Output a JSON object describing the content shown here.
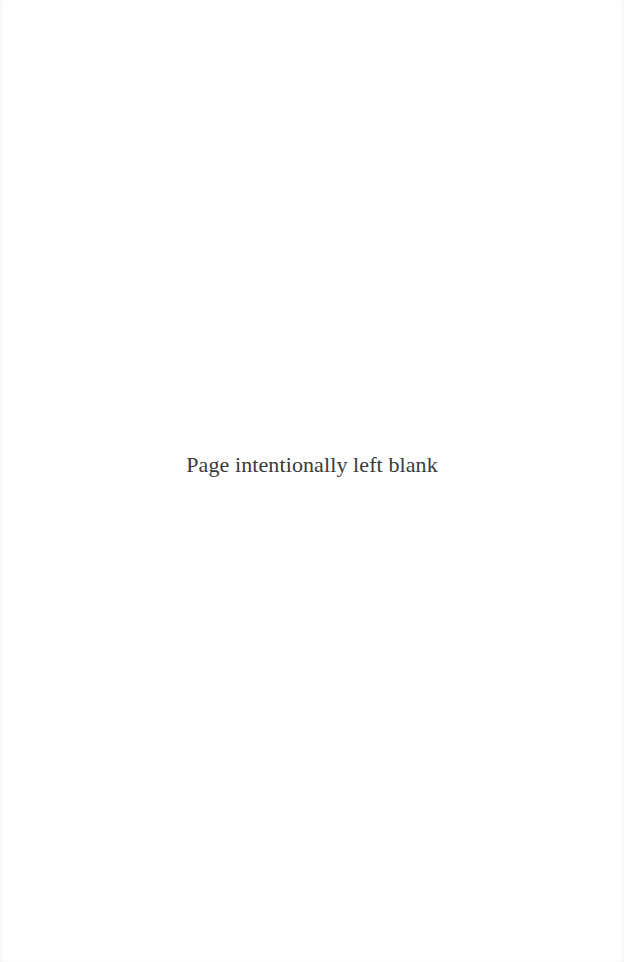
{
  "page": {
    "body_text": "Page intentionally left blank"
  }
}
